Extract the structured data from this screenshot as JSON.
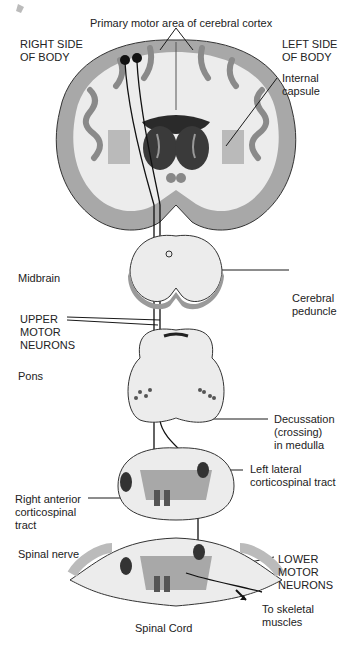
{
  "diagram": {
    "title_label": "Primary motor area of cerebral cortex",
    "labels": {
      "right_side": "RIGHT SIDE\nOF BODY",
      "left_side": "LEFT SIDE\nOF BODY",
      "internal_capsule": "Internal\ncapsule",
      "midbrain": "Midbrain",
      "cerebral_peduncle": "Cerebral\npeduncle",
      "upper_motor_neurons": "UPPER\nMOTOR\nNEURONS",
      "pons": "Pons",
      "decussation": "Decussation\n(crossing)\nin medulla",
      "left_lateral_tract": "Left lateral\ncorticospinal tract",
      "right_anterior_tract": "Right anterior\ncorticospinal\ntract",
      "spinal_nerve": "Spinal nerve",
      "lower_motor_neurons": "LOWER\nMOTOR\nNEURONS",
      "to_skeletal_muscles": "To skeletal\nmuscles",
      "spinal_cord": "Spinal Cord"
    },
    "colors": {
      "cortex_gray": "#a8a8a8",
      "white_matter": "#ebebeb",
      "dark_nuclei": "#3a3a3a",
      "line": "#1a1a1a"
    }
  }
}
